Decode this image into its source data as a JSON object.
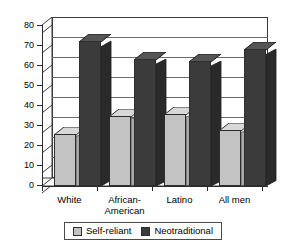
{
  "chart_data": {
    "type": "bar",
    "title": "",
    "subtitle": "",
    "xlabel": "",
    "ylabel": "",
    "ylim": [
      0,
      80
    ],
    "ytick_step": 10,
    "yticks": [
      "80",
      "70",
      "60",
      "50",
      "40",
      "30",
      "20",
      "10",
      "0"
    ],
    "grid": true,
    "legend_position": "bottom-center",
    "style_3d": true,
    "categories": [
      "White",
      "African-\nAmerican",
      "Latino",
      "All men"
    ],
    "category_lines": [
      [
        "White"
      ],
      [
        "African-",
        "American"
      ],
      [
        "Latino"
      ],
      [
        "All men"
      ]
    ],
    "series": [
      {
        "name": "Self-reliant",
        "color": "#c3c3c3",
        "values": [
          26,
          35,
          36,
          28
        ]
      },
      {
        "name": "Neotraditional",
        "color": "#3b3b3b",
        "values": [
          72,
          63,
          62,
          68
        ]
      }
    ]
  },
  "legend": {
    "items": [
      {
        "label": "Self-reliant",
        "swatch": "light-gray-swatch"
      },
      {
        "label": "Neotraditional",
        "swatch": "dark-gray-swatch"
      }
    ]
  },
  "colors": {
    "self_reliant": "#c3c3c3",
    "neotraditional": "#3b3b3b",
    "axis": "#2b2b2b",
    "grid": "#6a6a6a",
    "background": "#ffffff"
  }
}
